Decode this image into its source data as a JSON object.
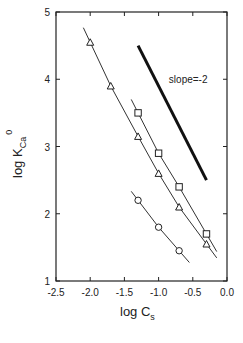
{
  "chart_data": {
    "type": "scatter",
    "title": "",
    "xlabel": "log C_s",
    "ylabel": "log K_Ca^0",
    "xlim": [
      -2.5,
      0.0
    ],
    "ylim": [
      1,
      5
    ],
    "x_ticks": [
      "-2.5",
      "-2.0",
      "-1.5",
      "-1.0",
      "-0.5",
      "0.0"
    ],
    "y_ticks": [
      "1",
      "2",
      "3",
      "4",
      "5"
    ],
    "grid": false,
    "legend": null,
    "annotations": [
      {
        "text": "slope=-2",
        "x": -0.85,
        "y": 4.0
      },
      {
        "type": "reference-line",
        "from": [
          -1.3,
          4.5
        ],
        "to": [
          -0.3,
          2.5
        ],
        "slope": -2
      }
    ],
    "series": [
      {
        "name": "triangles",
        "marker": "triangle",
        "x": [
          -2.0,
          -1.7,
          -1.3,
          -1.0,
          -0.7,
          -0.3
        ],
        "y": [
          4.55,
          3.9,
          3.15,
          2.6,
          2.1,
          1.55
        ]
      },
      {
        "name": "squares",
        "marker": "square",
        "x": [
          -1.3,
          -1.0,
          -0.7,
          -0.3
        ],
        "y": [
          3.5,
          2.9,
          2.4,
          1.7
        ]
      },
      {
        "name": "circles",
        "marker": "circle",
        "x": [
          -1.3,
          -1.0,
          -0.7
        ],
        "y": [
          2.2,
          1.8,
          1.45
        ]
      }
    ]
  },
  "labels": {
    "xlabel_main": "log C",
    "xlabel_sub": "s",
    "ylabel_main": "log K",
    "ylabel_sub": "Ca",
    "ylabel_sup": "0",
    "slope_text": "slope=-2"
  }
}
